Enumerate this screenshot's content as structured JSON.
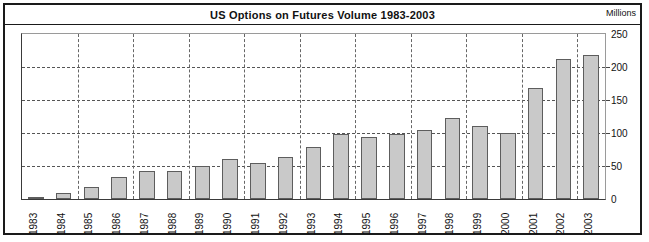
{
  "chart": {
    "title": "US Options on Futures Volume 1983-2003",
    "units_label": "Millions"
  },
  "chart_data": {
    "type": "bar",
    "title": "US Options on Futures Volume 1983-2003",
    "xlabel": "",
    "ylabel": "Millions",
    "ylim": [
      0,
      250
    ],
    "yticks": [
      0,
      50,
      100,
      150,
      200,
      250
    ],
    "grid": true,
    "legend": false,
    "axis_position": "right",
    "categories": [
      "1983",
      "1984",
      "1985",
      "1986",
      "1987",
      "1988",
      "1989",
      "1990",
      "1991",
      "1992",
      "1993",
      "1994",
      "1995",
      "1996",
      "1997",
      "1998",
      "1999",
      "2000",
      "2001",
      "2002",
      "2003"
    ],
    "values": [
      3,
      9,
      18,
      33,
      43,
      43,
      50,
      60,
      54,
      64,
      79,
      98,
      94,
      99,
      105,
      123,
      110,
      100,
      168,
      212,
      218
    ]
  }
}
